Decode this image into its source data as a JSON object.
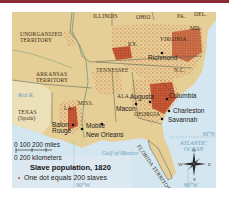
{
  "map": {
    "title": "Slave population, 1820",
    "legend": {
      "title": "Slave population, 1820",
      "dot_label": "One dot equals 200 slaves",
      "dot_color": "#c44a2a"
    },
    "regions": [
      {
        "name": "UNORGANIZED TERRITORY",
        "lines": [
          "UNORGANIZED",
          "TERRITORY"
        ]
      },
      {
        "name": "ILLINOIS",
        "label": "ILLINOIS"
      },
      {
        "name": "OHIO",
        "label": "OHIO"
      },
      {
        "name": "PA.",
        "label": "PA."
      },
      {
        "name": "DEL.",
        "label": "DEL."
      },
      {
        "name": "MD.",
        "label": "MD."
      },
      {
        "name": "KY.",
        "label": "KY."
      },
      {
        "name": "VIRGINIA",
        "label": "VIRGINIA"
      },
      {
        "name": "ARKANSAS TERRITORY",
        "lines": [
          "ARKANSAS",
          "TERRITORY"
        ]
      },
      {
        "name": "TENNESSEE",
        "label": "TENNESSEE"
      },
      {
        "name": "N.C.",
        "label": "N.C."
      },
      {
        "name": "S.C.",
        "label": "S.C."
      },
      {
        "name": "MISS.",
        "label": "MISS."
      },
      {
        "name": "ALA.",
        "label": "ALA."
      },
      {
        "name": "GEORGIA",
        "label": "GEORGIA"
      },
      {
        "name": "LA.",
        "label": "LA."
      },
      {
        "name": "TEXAS (Spain)",
        "lines": [
          "TEXAS",
          "(Spain)"
        ]
      },
      {
        "name": "FLORIDA TERRITORY",
        "label": "FLORIDA TERRITORY"
      }
    ],
    "cities": [
      "Richmond",
      "Augusta",
      "Columbia",
      "Macon",
      "Charleston",
      "Savannah",
      "Baton Rouge",
      "Mobile",
      "New Orleans"
    ],
    "water": {
      "gulf": "Gulf of Mexico",
      "ocean_line1": "ATLANTIC",
      "ocean_line2": "OCEAN",
      "red_river": "Red R."
    },
    "grid": {
      "lat_30": "30°N",
      "lon_90": "90°W",
      "lon_80": "80°W"
    },
    "scale": {
      "miles": "0  100 200 miles",
      "km": "0    200 kilometers"
    },
    "compass": {
      "n": "N",
      "s": "S",
      "e": "E",
      "w": "W"
    },
    "colors": {
      "land": "#e6cf96",
      "water": "#d4e6ef",
      "dots": "#c44a2a",
      "dense": "#b8462a",
      "border": "#4a5a50",
      "topbar": "#8c2a3a"
    }
  }
}
